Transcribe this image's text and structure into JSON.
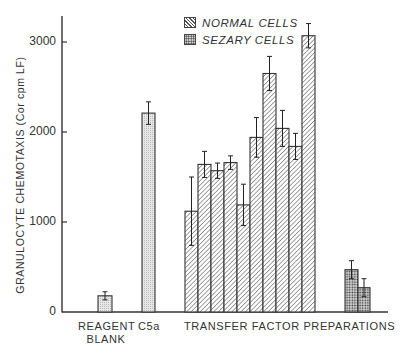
{
  "chart_data": {
    "type": "bar",
    "title": "",
    "xlabel": "",
    "ylabel": "GRANULOCYTE CHEMOTAXIS (Cor cpm LF)",
    "ylim": [
      0,
      3300
    ],
    "yticks": [
      0,
      1000,
      2000,
      3000
    ],
    "ytick_labels": [
      "0",
      "1000",
      "2000",
      "3000"
    ],
    "grid": false,
    "legend_position": "upper center",
    "legend": [
      {
        "name": "NORMAL CELLS",
        "pattern": "diagonal-hatch"
      },
      {
        "name": "SEZARY CELLS",
        "pattern": "crosshatch"
      }
    ],
    "x_groups": [
      {
        "label": "REAGENT\nBLANK",
        "label_line1": "REAGENT",
        "label_line2": "BLANK"
      },
      {
        "label": "C5a"
      },
      {
        "label": "TRANSFER FACTOR PREPARATIONS"
      }
    ],
    "bars": [
      {
        "group": "REAGENT BLANK",
        "series": "control",
        "value": 180,
        "error": 45
      },
      {
        "group": "C5a",
        "series": "control",
        "value": 2210,
        "error": 125
      },
      {
        "group": "TRANSFER FACTOR PREPARATIONS",
        "series": "NORMAL CELLS",
        "value": 1120,
        "error": 380
      },
      {
        "group": "TRANSFER FACTOR PREPARATIONS",
        "series": "NORMAL CELLS",
        "value": 1640,
        "error": 145
      },
      {
        "group": "TRANSFER FACTOR PREPARATIONS",
        "series": "NORMAL CELLS",
        "value": 1570,
        "error": 85
      },
      {
        "group": "TRANSFER FACTOR PREPARATIONS",
        "series": "NORMAL CELLS",
        "value": 1660,
        "error": 75
      },
      {
        "group": "TRANSFER FACTOR PREPARATIONS",
        "series": "NORMAL CELLS",
        "value": 1190,
        "error": 230
      },
      {
        "group": "TRANSFER FACTOR PREPARATIONS",
        "series": "NORMAL CELLS",
        "value": 1940,
        "error": 220
      },
      {
        "group": "TRANSFER FACTOR PREPARATIONS",
        "series": "NORMAL CELLS",
        "value": 2650,
        "error": 190
      },
      {
        "group": "TRANSFER FACTOR PREPARATIONS",
        "series": "NORMAL CELLS",
        "value": 2040,
        "error": 200
      },
      {
        "group": "TRANSFER FACTOR PREPARATIONS",
        "series": "NORMAL CELLS",
        "value": 1840,
        "error": 145
      },
      {
        "group": "TRANSFER FACTOR PREPARATIONS",
        "series": "NORMAL CELLS",
        "value": 3070,
        "error": 135
      },
      {
        "group": "TRANSFER FACTOR PREPARATIONS",
        "series": "SEZARY CELLS",
        "value": 470,
        "error": 100
      },
      {
        "group": "TRANSFER FACTOR PREPARATIONS",
        "series": "SEZARY CELLS",
        "value": 270,
        "error": 100
      }
    ],
    "series": [
      {
        "name": "NORMAL CELLS",
        "values": [
          1120,
          1640,
          1570,
          1660,
          1190,
          1940,
          2650,
          2040,
          1840,
          3070
        ]
      },
      {
        "name": "SEZARY CELLS",
        "values": [
          470,
          270
        ]
      }
    ]
  },
  "layout": {
    "x0": 62,
    "y0": 312,
    "px_per_unit": 0.09,
    "axis_top": 16,
    "axis_right": 388,
    "bar_x": [
      98,
      142,
      185,
      198,
      211,
      224,
      237,
      250,
      263,
      276,
      289,
      302,
      345,
      358
    ],
    "bar_w": [
      14,
      13,
      13,
      13,
      13,
      13,
      13,
      13,
      13,
      13,
      13,
      13,
      13,
      12
    ],
    "bar_fill": [
      "dots-light",
      "dots-light",
      "hatch",
      "hatch",
      "hatch",
      "hatch",
      "hatch",
      "hatch",
      "hatch",
      "hatch",
      "hatch",
      "hatch",
      "cross",
      "cross"
    ]
  },
  "labels": {
    "ylabel": "GRANULOCYTE CHEMOTAXIS (Cor cpm LF)",
    "yticks": [
      "3000",
      "2000",
      "1000",
      "0"
    ],
    "x_reagent_1": "REAGENT",
    "x_reagent_2": "BLANK",
    "x_c5a": "C5a",
    "x_transfer": "TRANSFER FACTOR PREPARATIONS",
    "legend_normal": "NORMAL CELLS",
    "legend_sezary": "SEZARY CELLS"
  }
}
